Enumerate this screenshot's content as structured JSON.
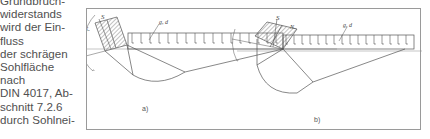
{
  "text_column": {
    "lines": [
      "Grundbruch-",
      "widerstands",
      "wird der Ein-",
      "fluss",
      "der schrägen",
      "Sohlfläche",
      "nach",
      "DIN 4017, Ab-",
      "schnitt 7.2.6",
      "durch Sohlnei-"
    ]
  },
  "figure": {
    "panels": [
      {
        "caption": "a)",
        "labels": {
          "force": "S",
          "normal": "Nᵤ",
          "load": "g, d",
          "angle_small": "α",
          "angle_big": "α₀"
        }
      },
      {
        "caption": "b)",
        "labels": {
          "force": "S",
          "normal": "Nᵤ",
          "load": "g, d",
          "angle_small": "α",
          "angle_big": "α₀"
        }
      }
    ],
    "colors": {
      "line": "#555555",
      "frame": "#9a9a9a",
      "hatch": "#666666"
    }
  }
}
